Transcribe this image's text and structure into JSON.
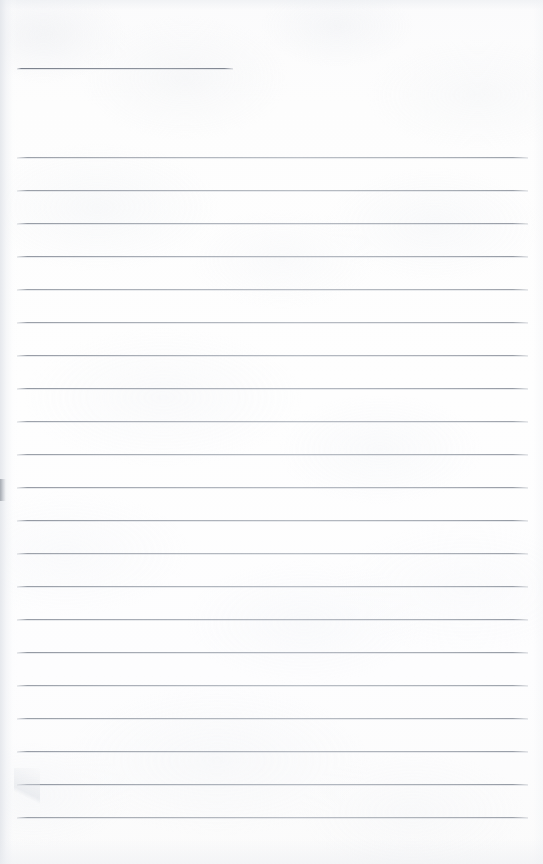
{
  "document": {
    "kind": "scanned-lined-paper",
    "title": "Blank Lined Notebook Page",
    "orientation": "portrait",
    "page_width_px": 543,
    "page_height_px": 864,
    "paper_color": "#fdfdfd",
    "rule_color": "#8c929c",
    "rule_ghost_color": "#cdd1d8",
    "content_text": "",
    "has_handwriting": false,
    "has_printed_text": false,
    "header_rule": {
      "label": "header-rule",
      "y": 68,
      "x_start": 17,
      "x_end": 233,
      "thickness_px": 1
    },
    "body_rules": {
      "label": "body-rules",
      "count": 21,
      "x_start": 17,
      "x_end": 528,
      "first_y": 157,
      "spacing_px": 33,
      "thickness_px": 1,
      "y_positions": [
        157,
        190,
        223,
        256,
        289,
        322,
        355,
        388,
        421,
        454,
        487,
        520,
        553,
        586,
        619,
        652,
        685,
        718,
        751,
        784,
        817
      ]
    },
    "artifacts": {
      "left_edge_shadow": true,
      "top_edge_shadow": true,
      "bottom_edge_shadow": true,
      "right_edge_shadow": true,
      "margin_smudge_y": 479,
      "corner_fold_bottom_left": true
    }
  }
}
